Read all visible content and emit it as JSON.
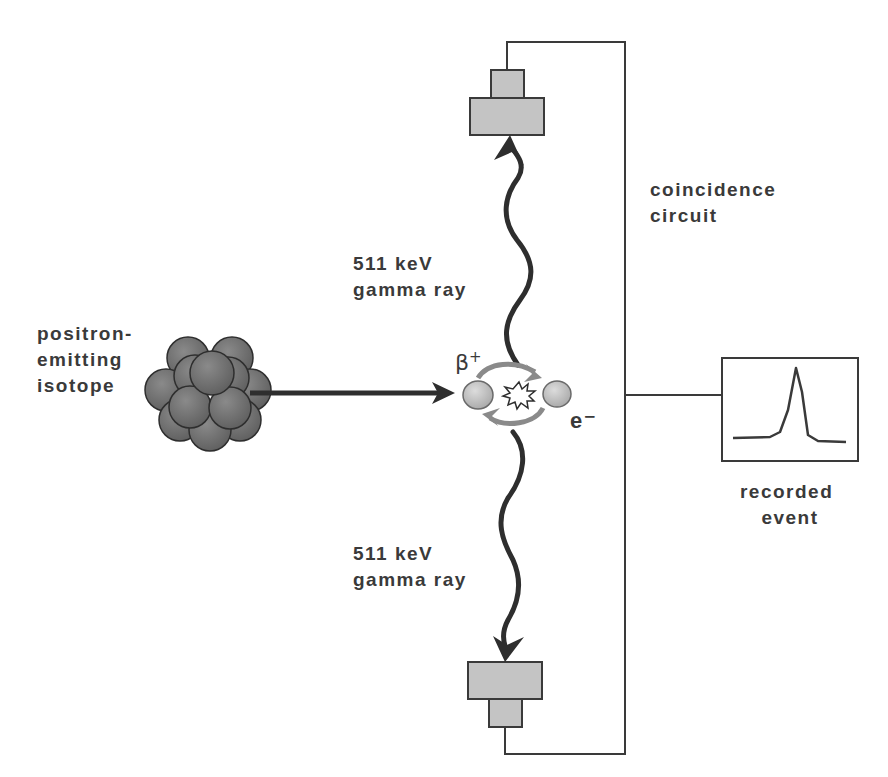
{
  "diagram": {
    "labels": {
      "isotope": [
        "positron-",
        "emitting",
        "isotope"
      ],
      "gamma_top": [
        "511 keV",
        "gamma ray"
      ],
      "gamma_bottom": [
        "511 keV",
        "gamma ray"
      ],
      "coincidence": [
        "coincidence",
        "circuit"
      ],
      "recorded": [
        "recorded",
        "event"
      ],
      "positron_symbol": "β",
      "positron_charge": "+",
      "electron_symbol": "e⁻"
    },
    "components": [
      {
        "id": "isotope",
        "kind": "nucleus-cluster"
      },
      {
        "id": "positron",
        "kind": "particle"
      },
      {
        "id": "electron",
        "kind": "particle"
      },
      {
        "id": "annihilation",
        "kind": "burst"
      },
      {
        "id": "detector-top",
        "kind": "detector"
      },
      {
        "id": "detector-bottom",
        "kind": "detector"
      },
      {
        "id": "coincidence-circuit",
        "kind": "wire"
      },
      {
        "id": "recorded-event",
        "kind": "display"
      }
    ],
    "colors": {
      "ink": "#3a3a3a",
      "detector_fill": "#c4c4c4",
      "nucleus_fill": "#747474",
      "particle_fill": "#c8c8c8",
      "swirl": "#8a8a8a"
    }
  }
}
